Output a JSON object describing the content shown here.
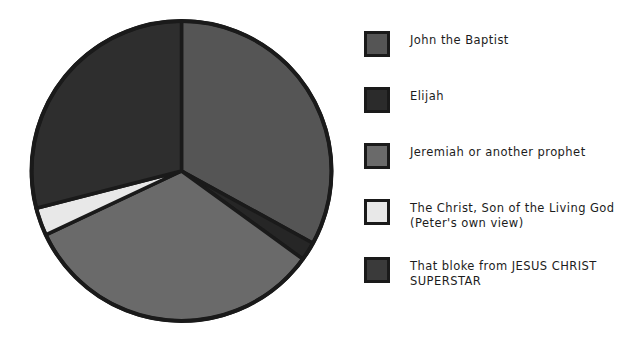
{
  "chart_data": {
    "type": "pie",
    "title": "",
    "subtitle": "",
    "xlabel": "",
    "ylabel": "",
    "legend_position": "right",
    "grid": false,
    "start_angle_deg": 90,
    "direction": "clockwise",
    "categories": [
      "John the Baptist",
      "Elijah",
      "Jeremiah or another prophet",
      "The Christ, Son of the Living God (Peter's own view)",
      "That bloke from JESUS CHRIST SUPERSTAR"
    ],
    "values": [
      33,
      2,
      33,
      3,
      29
    ],
    "colors": [
      "#555555",
      "#262626",
      "#6a6a6a",
      "#e8e8e8",
      "#2e2e2e"
    ],
    "slices": [
      {
        "label": "John the Baptist",
        "value": 33,
        "color": "#555555"
      },
      {
        "label": "Elijah",
        "value": 2,
        "color": "#262626"
      },
      {
        "label": "Jeremiah or another prophet",
        "value": 33,
        "color": "#6a6a6a"
      },
      {
        "label": "The Christ, Son of the Living God (Peter's own view)",
        "value": 3,
        "color": "#e8e8e8"
      },
      {
        "label": "That bloke from JESUS CHRIST SUPERSTAR",
        "value": 29,
        "color": "#2e2e2e"
      }
    ]
  },
  "legend": {
    "items": [
      {
        "label": "John the Baptist",
        "color": "#555555"
      },
      {
        "label": "Elijah",
        "color": "#2b2b2b"
      },
      {
        "label": "Jeremiah or another prophet",
        "color": "#6a6a6a"
      },
      {
        "label": "The Christ, Son of the Living God (Peter's own view)",
        "color": "#e8e8e8"
      },
      {
        "label": "That bloke from JESUS CHRIST SUPERSTAR",
        "color": "#3a3a3a"
      }
    ]
  },
  "style": {
    "outline_color": "#1a1a1a",
    "background": "#ffffff"
  }
}
